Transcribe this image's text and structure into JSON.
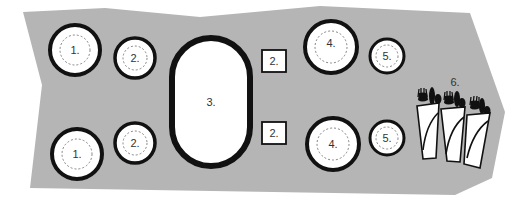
{
  "colors": {
    "table_surface": "#b5b5b5",
    "outline": "#111111",
    "fill": "#ffffff",
    "label": "#333333"
  },
  "diagram": {
    "labels": {
      "dinner_plate": "1.",
      "side_item": "2.",
      "serving_platter": "3.",
      "charger_plate": "4.",
      "small_plate": "5.",
      "cutlery": "6."
    }
  }
}
